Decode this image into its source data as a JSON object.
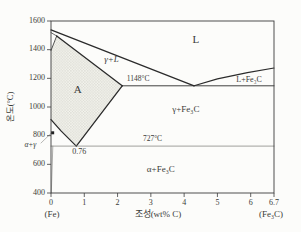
{
  "chart_data": {
    "type": "line",
    "title": "",
    "xlabel": "조성(wt% C)",
    "ylabel": "온도(°C)",
    "x_left_annotation": "(Fe)",
    "x_right_annotation": "(Fe₃C)",
    "xlim": [
      0,
      6.7
    ],
    "ylim": [
      400,
      1600
    ],
    "grid": false,
    "legend": "none",
    "x_ticks": [
      {
        "v": 0,
        "label": "0"
      },
      {
        "v": 1,
        "label": "1"
      },
      {
        "v": 2,
        "label": "2"
      },
      {
        "v": 3,
        "label": "3"
      },
      {
        "v": 4,
        "label": "4"
      },
      {
        "v": 5,
        "label": "5"
      },
      {
        "v": 6,
        "label": "6"
      },
      {
        "v": 6.7,
        "label": "6.7"
      }
    ],
    "y_ticks": [
      {
        "v": 400,
        "label": "400"
      },
      {
        "v": 600,
        "label": "600"
      },
      {
        "v": 800,
        "label": "800"
      },
      {
        "v": 1000,
        "label": "1000"
      },
      {
        "v": 1200,
        "label": "1200"
      },
      {
        "v": 1400,
        "label": "1400"
      },
      {
        "v": 1600,
        "label": "1600"
      }
    ],
    "key_points": {
      "eutectic": {
        "wt_pct_c": 4.3,
        "temp_c": 1148,
        "label": "1148°C"
      },
      "eutectoid": {
        "wt_pct_c": 0.76,
        "temp_c": 727,
        "label": "727°C",
        "composition_label": "0.76"
      },
      "max_c_in_gamma": {
        "wt_pct_c": 2.14,
        "temp_c": 1148
      },
      "peritectic": {
        "wt_pct_c": 0.17,
        "temp_c": 1495
      },
      "fe_melting_temp_c": 1538,
      "a3_pure_fe_temp_c": 912,
      "delta_to_gamma_temp_c": 1394
    },
    "series": [
      {
        "name": "liquidus-left",
        "points": [
          [
            0,
            1538
          ],
          [
            4.3,
            1148
          ]
        ],
        "width": 1.3,
        "shade": "dark"
      },
      {
        "name": "liquidus-right",
        "points": [
          [
            4.3,
            1148
          ],
          [
            5.0,
            1196
          ],
          [
            5.9,
            1240
          ],
          [
            6.7,
            1272
          ]
        ],
        "width": 1.1,
        "shade": "dark"
      },
      {
        "name": "delta-liquidus-lower",
        "points": [
          [
            0,
            1519
          ],
          [
            0.17,
            1495
          ]
        ],
        "width": 0.7,
        "shade": "dark"
      },
      {
        "name": "delta-gamma-boundary",
        "points": [
          [
            0,
            1394
          ],
          [
            0.17,
            1495
          ]
        ],
        "width": 0.8,
        "shade": "dark"
      },
      {
        "name": "solidus-gamma",
        "points": [
          [
            0.17,
            1495
          ],
          [
            2.14,
            1148
          ]
        ],
        "width": 1.3,
        "shade": "dark"
      },
      {
        "name": "eutectic-line-1148",
        "points": [
          [
            2.14,
            1148
          ],
          [
            6.7,
            1148
          ]
        ],
        "width": 0.9,
        "shade": "dark"
      },
      {
        "name": "acm-line",
        "points": [
          [
            0.76,
            727
          ],
          [
            2.14,
            1148
          ]
        ],
        "width": 1.3,
        "shade": "dark"
      },
      {
        "name": "a3-line",
        "points": [
          [
            0,
            912
          ],
          [
            0.3,
            833
          ],
          [
            0.76,
            727
          ]
        ],
        "width": 1.3,
        "shade": "dark"
      },
      {
        "name": "eutectoid-line-727",
        "points": [
          [
            0,
            727
          ],
          [
            6.7,
            727
          ]
        ],
        "width": 0.8,
        "shade": "light"
      },
      {
        "name": "alpha-solvus",
        "points": [
          [
            0.055,
            727
          ],
          [
            0.01,
            400
          ]
        ],
        "width": 0.7,
        "shade": "light"
      },
      {
        "name": "alpha-gamma-leader",
        "points": [
          [
            -0.3,
            749
          ],
          [
            0.015,
            819
          ]
        ],
        "width": 0.6,
        "shade": "light"
      }
    ],
    "shaded_region": {
      "name": "austenite-A-region",
      "points": [
        [
          0.17,
          1495
        ],
        [
          2.14,
          1148
        ],
        [
          0.76,
          727
        ],
        [
          0,
          912
        ],
        [
          0,
          1394
        ]
      ]
    },
    "labels": [
      {
        "name": "region-label-liquid",
        "text": "L",
        "x": 4.35,
        "y": 1462,
        "size": 11,
        "italic": false
      },
      {
        "name": "region-label-gamma-plus-liquid",
        "text": "γ+L",
        "x": 1.82,
        "y": 1330,
        "size": 9,
        "italic": true
      },
      {
        "name": "temp-label-1148",
        "text": "1148°C",
        "x": 2.62,
        "y": 1192,
        "size": 7.5,
        "italic": false
      },
      {
        "name": "region-label-liquid-plus-fe3c",
        "text": "L+Fe₃C",
        "x": 5.95,
        "y": 1190,
        "size": 8,
        "italic": false
      },
      {
        "name": "region-label-austenite-A",
        "text": "A",
        "x": 0.8,
        "y": 1118,
        "size": 11,
        "italic": false
      },
      {
        "name": "region-label-gamma-plus-fe3c",
        "text": "γ+Fe₃C",
        "x": 4.05,
        "y": 982,
        "size": 9,
        "italic": false
      },
      {
        "name": "temp-label-727",
        "text": "727°C",
        "x": 3.05,
        "y": 772,
        "size": 7.5,
        "italic": false
      },
      {
        "name": "comp-label-0-76",
        "text": "0.76",
        "x": 0.85,
        "y": 688,
        "size": 8,
        "italic": false
      },
      {
        "name": "region-label-alpha-plus-fe3c",
        "text": "α+Fe₃C",
        "x": 3.3,
        "y": 562,
        "size": 9,
        "italic": false
      },
      {
        "name": "region-label-alpha-plus-gamma",
        "text": "α+γ",
        "x": -0.62,
        "y": 733,
        "size": 7.5,
        "italic": true
      }
    ],
    "point_marker": {
      "x": 0.05,
      "y": 820
    },
    "colors": {
      "dark_line": "#2b2b2b",
      "light_line": "#8a8a86",
      "border": "#3c3c3c",
      "text": "#3b3b38",
      "fill_base": "#f2f2ec",
      "fill_dots": "#c3c3b9",
      "background": "#fcfcfa"
    }
  }
}
